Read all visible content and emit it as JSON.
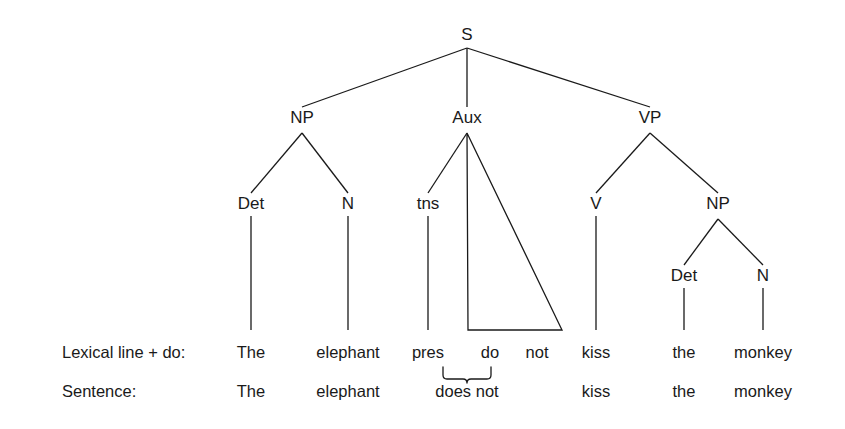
{
  "diagram": {
    "type": "syntax-tree",
    "title": "",
    "background_color": "#ffffff",
    "line_color": "#1a1a1a",
    "nodes": {
      "s": "S",
      "np_subject": "NP",
      "aux": "Aux",
      "vp": "VP",
      "det_subject": "Det",
      "n_subject": "N",
      "tns": "tns",
      "v": "V",
      "np_object": "NP",
      "det_object": "Det",
      "n_object": "N"
    },
    "rows": {
      "lexical": {
        "label": "Lexical line + do:",
        "words": [
          "The",
          "elephant",
          "pres",
          "do",
          "not",
          "kiss",
          "the",
          "monkey"
        ]
      },
      "sentence": {
        "label": "Sentence:",
        "words": [
          "The",
          "elephant",
          "does not",
          "kiss",
          "the",
          "monkey"
        ]
      }
    },
    "contraction": {
      "from": [
        "pres",
        "do"
      ],
      "to": "does"
    }
  }
}
